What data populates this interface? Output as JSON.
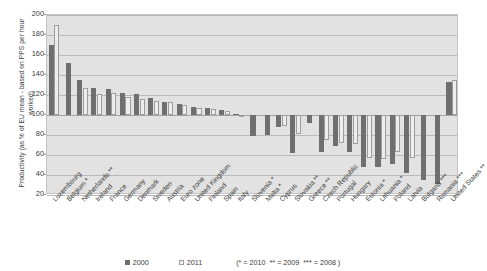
{
  "axis": {
    "y_title": "Productivity (as % of EU mean - based on PPS per hour worked)",
    "y_ticks": [
      200,
      180,
      160,
      140,
      120,
      100,
      80,
      60,
      40,
      20
    ]
  },
  "legend": {
    "series_2000": "2000",
    "series_2011": "2011",
    "note": "(* = 2010  ** = 2009  *** = 2008 )",
    "color_2000": "#6f6f6f",
    "color_2011": "#ededed"
  },
  "chart_data": {
    "type": "bar",
    "title": "",
    "subtitle": "",
    "xlabel": "",
    "ylabel": "Productivity (as % of EU mean - based on PPS per hour worked)",
    "ylim": [
      20,
      200
    ],
    "ytick_step": 20,
    "grid": true,
    "baseline": 100,
    "legend_position": "bottom-center",
    "annotations": [
      "* = 2010",
      "** = 2009",
      "*** = 2008"
    ],
    "categories": [
      "Luxembourg",
      "Belgium *",
      "Netherlands **",
      "Ireland",
      "France",
      "Germany",
      "Denmark",
      "Sweden",
      "Austria",
      "Euro zone",
      "United Kingdom",
      "Finland",
      "Spain",
      "Italy",
      "Slovenia *",
      "Malta *",
      "Cyprus",
      "Slovakia **",
      "Greece **",
      "Czech Republic",
      "Portugal",
      "Hungary",
      "Estonia *",
      "Lithuania *",
      "Poland",
      "Latvia",
      "Bulgaria ***",
      "Romania ***",
      "United States **"
    ],
    "series": [
      {
        "name": "2000",
        "color": "#6f6f6f",
        "values": [
          170,
          152,
          135,
          127,
          126,
          122,
          121,
          117,
          113,
          111,
          108,
          107,
          105,
          101,
          79,
          80,
          88,
          62,
          92,
          63,
          69,
          63,
          48,
          48,
          51,
          42,
          35,
          31,
          133
        ]
      },
      {
        "name": "2011",
        "color": "#ededed",
        "values": [
          190,
          null,
          127,
          121,
          122,
          118,
          116,
          114,
          113,
          110,
          107,
          106,
          104,
          99,
          null,
          null,
          89,
          81,
          null,
          75,
          72,
          71,
          57,
          56,
          63,
          57,
          null,
          null,
          135
        ]
      }
    ]
  }
}
